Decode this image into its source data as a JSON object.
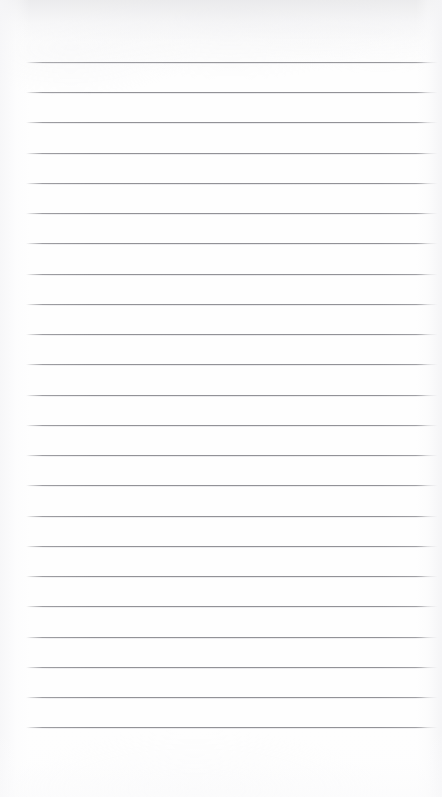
{
  "document": {
    "kind": "lined-notepad-page",
    "title": "Blank Lined Paper",
    "text_content": "",
    "background_color": "#ffffff",
    "paper_tone": "#fefefe",
    "width_px": 442,
    "height_px": 797
  },
  "ruling": {
    "line_color": "#92929a",
    "line_thickness_px": 1,
    "line_count": 23,
    "line_spacing_px": 30.2,
    "left_margin_px": 26,
    "right_margin_px": 438,
    "first_line_y_px": 62,
    "last_line_y_px": 727,
    "has_vertical_margin_rule": false,
    "line_positions_y": [
      62,
      92,
      122,
      153,
      183,
      213,
      243,
      274,
      304,
      334,
      364,
      395,
      425,
      455,
      485,
      516,
      546,
      576,
      606,
      637,
      667,
      697,
      727
    ]
  },
  "content": {
    "written_text": [],
    "note": ""
  },
  "scan_artifacts": {
    "top_shadow": true,
    "left_shadow": true,
    "right_shadow": true,
    "bottom_shadow": true
  }
}
